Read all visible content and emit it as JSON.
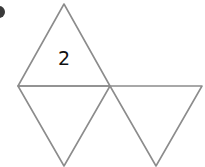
{
  "diagram": {
    "type": "triangular-net",
    "colors": {
      "background": "#ffffff",
      "edge": "#8c8c8c",
      "label": "#111111",
      "bullet": "#3a3a3a"
    },
    "faces": [
      {
        "id": "top",
        "label": "2"
      },
      {
        "id": "bottom-left",
        "label": ""
      },
      {
        "id": "bottom-right",
        "label": ""
      },
      {
        "id": "middle-up",
        "label": ""
      }
    ]
  }
}
